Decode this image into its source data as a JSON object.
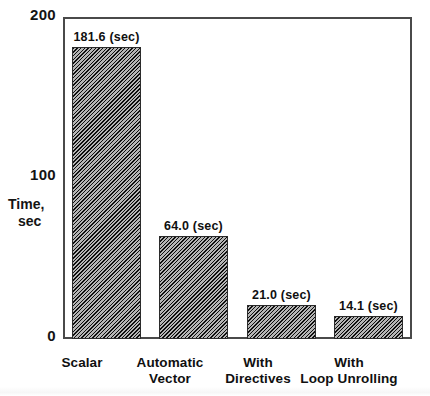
{
  "chart_data": {
    "type": "bar",
    "title": "",
    "xlabel": "",
    "ylabel": "Time, sec",
    "ylabel_line1": "Time,",
    "ylabel_line2": "sec",
    "ylim": [
      0,
      200
    ],
    "yticks": [
      "0",
      "100",
      "200"
    ],
    "grid": false,
    "legend": "none",
    "units": "sec",
    "categories": [
      "Scalar",
      "Automatic Vector",
      "With Directives",
      "With Loop Unrolling"
    ],
    "category_lines": [
      [
        "Scalar"
      ],
      [
        "Automatic",
        "Vector"
      ],
      [
        "With",
        "Directives"
      ],
      [
        "With",
        "Loop Unrolling"
      ]
    ],
    "values": [
      181.6,
      64.0,
      21.0,
      14.1
    ],
    "value_labels": [
      "181.6 (sec)",
      "64.0 (sec)",
      "21.0 (sec)",
      "14.1 (sec)"
    ],
    "bar_color": "#5c5c5c",
    "bar_pattern": "diagonal-hatch",
    "bar_edge_color": "#2b2b2b",
    "axis_color": "#4a4a4a",
    "background_color": "#ffffff"
  }
}
